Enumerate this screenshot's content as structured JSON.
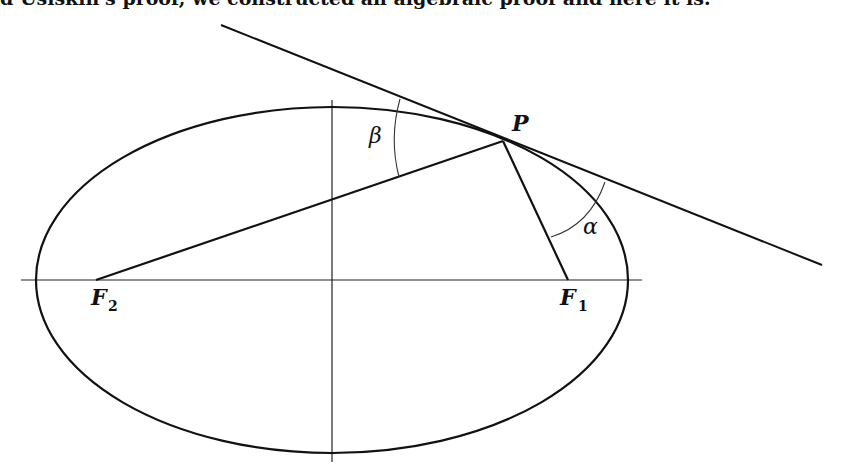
{
  "caption": "d Usiskin's proof, we constructed an algebraic proof and here it is.",
  "figure": {
    "labels": {
      "point": "P",
      "focus_left": "F",
      "focus_left_sub": "2",
      "focus_right": "F",
      "focus_right_sub": "1",
      "angle_left": "β",
      "angle_right": "α"
    },
    "ink_color": "#111111"
  }
}
